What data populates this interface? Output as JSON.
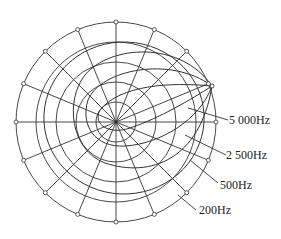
{
  "diagram": {
    "type": "polar_directivity_pattern",
    "center": [
      116,
      122
    ],
    "ring_radii": [
      20,
      40,
      60,
      80,
      100
    ],
    "radial_angles_deg": [
      0,
      22.5,
      45,
      67.5,
      90,
      112.5,
      135,
      157.5,
      180,
      202.5,
      225,
      247.5,
      270,
      292.5,
      315,
      337.5
    ],
    "line_color": "#333333",
    "curves": [
      {
        "label": "5 000Hz",
        "id": "curve-5000"
      },
      {
        "label": "2 500Hz",
        "id": "curve-2500"
      },
      {
        "label": "500Hz",
        "id": "curve-500"
      },
      {
        "label": "200Hz",
        "id": "curve-200"
      }
    ],
    "labels": {
      "f5000": "5 000Hz",
      "f2500": "2 500Hz",
      "f500": "500Hz",
      "f200": "200Hz"
    }
  }
}
